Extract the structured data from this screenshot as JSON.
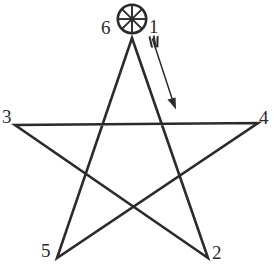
{
  "figure": {
    "background_color": "#ffffff",
    "ink_color": "#2b2b2b",
    "width": 277,
    "height": 272
  },
  "diagram": {
    "shape": "five-pointed star drawn as one continuous stroke",
    "start_marker": {
      "name": "wheel-marker",
      "description": "circle with eight radial spokes marking the starting point",
      "center_x": 132,
      "center_y": 19,
      "radius": 15,
      "spoke_count": 8
    },
    "direction_arrow": {
      "name": "direction-arrow",
      "description": "fletched arrow indicating the drawing direction from vertex 1 downward to the right",
      "from_x": 152,
      "from_y": 38,
      "to_x": 176,
      "to_y": 108
    },
    "vertices": [
      {
        "id": "1",
        "label": "1",
        "x": 132,
        "y": 38,
        "role": "top point / start"
      },
      {
        "id": "2",
        "label": "2",
        "x": 208,
        "y": 258,
        "role": "bottom right point"
      },
      {
        "id": "3",
        "label": "3",
        "x": 15,
        "y": 125,
        "role": "left point"
      },
      {
        "id": "4",
        "label": "4",
        "x": 258,
        "y": 123,
        "role": "right point"
      },
      {
        "id": "5",
        "label": "5",
        "x": 57,
        "y": 258,
        "role": "bottom left point"
      },
      {
        "id": "6",
        "label": "6",
        "x": 132,
        "y": 38,
        "role": "return to top point / end"
      }
    ],
    "stroke_order": [
      "1",
      "2",
      "3",
      "4",
      "5",
      "6"
    ],
    "stroke_width": 2.6
  },
  "chart_data": {
    "type": "line",
    "xlabel": "",
    "ylabel": "",
    "categories": [
      "1",
      "2",
      "3",
      "4",
      "5",
      "6"
    ],
    "series": [
      {
        "name": "stroke path",
        "points": [
          {
            "label": "1",
            "x": 132,
            "y": 38
          },
          {
            "label": "2",
            "x": 208,
            "y": 258
          },
          {
            "label": "3",
            "x": 15,
            "y": 125
          },
          {
            "label": "4",
            "x": 258,
            "y": 123
          },
          {
            "label": "5",
            "x": 57,
            "y": 258
          },
          {
            "label": "6",
            "x": 132,
            "y": 38
          }
        ]
      }
    ],
    "annotations": [
      {
        "name": "wheel-marker",
        "text": "",
        "x": 132,
        "y": 19
      },
      {
        "name": "direction-arrow",
        "text": "",
        "x1": 152,
        "y1": 38,
        "x2": 176,
        "y2": 108
      }
    ],
    "legend": [],
    "grid": false
  }
}
